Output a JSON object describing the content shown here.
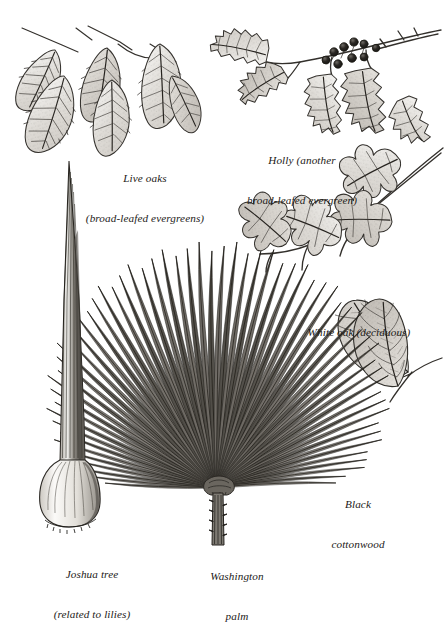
{
  "plate": {
    "kind": "botanical-illustration",
    "background_color": "#ffffff",
    "ink_color": "#2a2724",
    "width": 445,
    "height": 606,
    "style": "pen-and-ink engraving / stipple line drawing"
  },
  "captions": {
    "live_oaks": {
      "line1": "Live oaks",
      "line2": "(broad-leafed evergreens)"
    },
    "holly": {
      "line1": "Holly (another",
      "line2": "broad-leafed evergreen)"
    },
    "white_oak": {
      "line1": "White oak (deciduous)",
      "line2": ""
    },
    "black_cottonwood": {
      "line1": "Black",
      "line2": "cottonwood"
    },
    "joshua_tree": {
      "line1": "Joshua tree",
      "line2": "(related to lilies)"
    },
    "washington_palm": {
      "line1": "Washington",
      "line2": "palm"
    }
  },
  "specimens": [
    {
      "name": "live-oaks",
      "label": "Live oaks",
      "note": "broad-leafed evergreens",
      "position": "top-left",
      "leaf_count": 6,
      "leaf_shape": "elliptic, serrate margin, acuminate tip, pinnate venation"
    },
    {
      "name": "holly",
      "label": "Holly",
      "note": "another broad-leafed evergreen",
      "position": "top-right",
      "leaf_count": 5,
      "berry_count": 9,
      "leaf_shape": "oblong with spiny-toothed margin",
      "berry_color": "#1d1b19"
    },
    {
      "name": "white-oak",
      "label": "White oak",
      "note": "deciduous",
      "position": "middle-right",
      "leaf_count": 4,
      "leaf_shape": "deeply pinnately lobed with rounded lobes"
    },
    {
      "name": "black-cottonwood",
      "label": "Black cottonwood",
      "note": "",
      "position": "lower-right",
      "leaf_count": 2,
      "leaf_shape": "broadly ovate, acuminate tip, dense reticulate venation"
    },
    {
      "name": "joshua-tree",
      "label": "Joshua tree",
      "note": "related to lilies",
      "position": "lower-left",
      "leaf_count": 1,
      "leaf_shape": "long rigid dagger-like blade with broad clasping base"
    },
    {
      "name": "washington-palm",
      "label": "Washington palm",
      "note": "",
      "position": "bottom-center",
      "segment_count": 62,
      "leaf_shape": "palmate fan with radiating folded segments on spiny petiole"
    }
  ]
}
